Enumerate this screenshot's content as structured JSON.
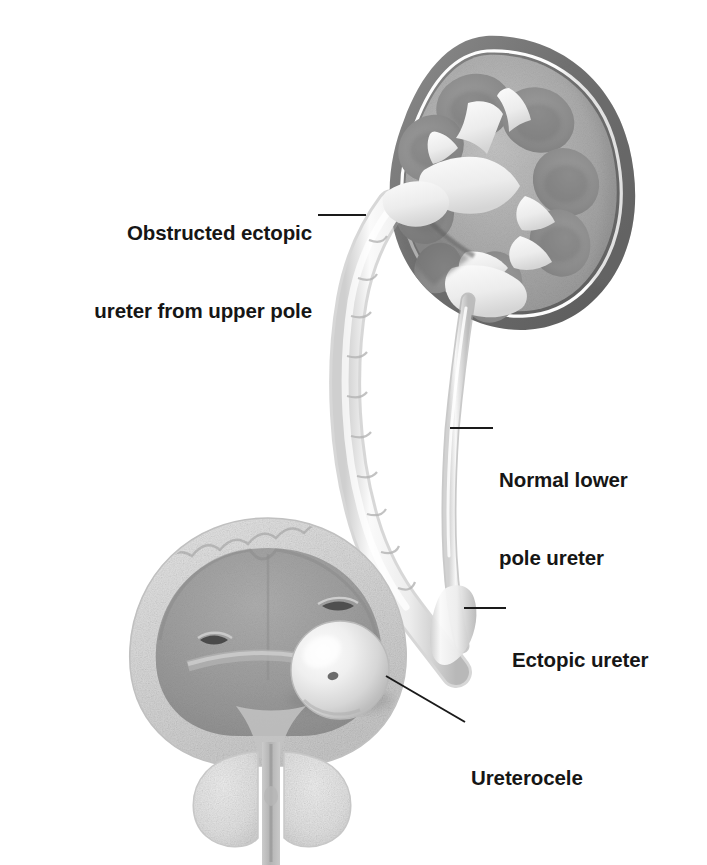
{
  "figure": {
    "background_color": "#ffffff",
    "style": "grayscale medical illustration",
    "palette": {
      "capsule_dark": "#6e6e6e",
      "capsule_shadow": "#5f5f5f",
      "cortex_mid": "#a9a9a9",
      "medulla_pyramid": "#8e8e8e",
      "collecting_system": "#f2f2f2",
      "highlight_white": "#ffffff",
      "bladder_wall": "#d9d9d9",
      "bladder_lumen": "#9c9c9c",
      "ureter_light": "#ededed",
      "ureter_shade": "#bfbfbf",
      "prostate": "#e2e2e2",
      "leader_line": "#1a1a1a",
      "text_color": "#161616"
    }
  },
  "labels": [
    {
      "id": "obstructed-ectopic-ureter",
      "lines": [
        "Obstructed ectopic",
        "ureter from upper pole"
      ],
      "align": "right",
      "text_right_x": 312,
      "text_top_y": 168,
      "leader": {
        "x1": 318,
        "y1": 215,
        "x2": 366,
        "y2": 215
      }
    },
    {
      "id": "normal-lower-pole-ureter",
      "lines": [
        "Normal lower",
        "pole ureter"
      ],
      "align": "left",
      "text_left_x": 499,
      "text_top_y": 415,
      "leader": {
        "x1": 450,
        "y1": 428,
        "x2": 493,
        "y2": 428
      }
    },
    {
      "id": "ectopic-ureter",
      "lines": [
        "Ectopic ureter"
      ],
      "align": "left",
      "text_left_x": 512,
      "text_top_y": 595,
      "leader": {
        "x1": 464,
        "y1": 608,
        "x2": 506,
        "y2": 608
      }
    },
    {
      "id": "ureterocele",
      "lines": [
        "Ureterocele"
      ],
      "align": "left",
      "text_left_x": 471,
      "text_top_y": 713,
      "leader": {
        "x1": 386,
        "y1": 676,
        "x2": 465,
        "y2": 722
      }
    }
  ],
  "anatomy": {
    "kidney": {
      "name": "duplex kidney, coronal cross-section",
      "center_x": 492,
      "center_y": 178,
      "pyramid_count": 7
    },
    "upper_pole_ureter": {
      "name": "obstructed dilated ectopic ureter from upper pole",
      "state": "dilated and tortuous"
    },
    "lower_pole_ureter": {
      "name": "normal lower pole ureter",
      "state": "normal caliber"
    },
    "bladder": {
      "name": "urinary bladder, coronal cross-section",
      "center_x": 268,
      "center_y": 640
    },
    "ureterocele": {
      "name": "ureterocele within bladder",
      "center_x": 340,
      "center_y": 670,
      "radius": 49
    },
    "prostate": {
      "name": "prostate gland with urethra",
      "center_x": 281,
      "center_y": 792
    }
  }
}
